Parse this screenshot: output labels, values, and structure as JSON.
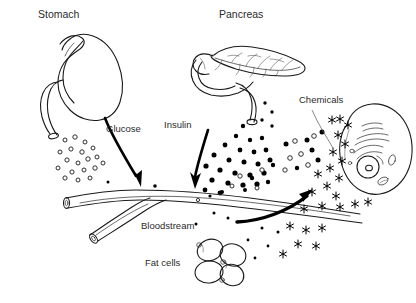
{
  "figure": {
    "background_color": "#ffffff",
    "ink_color": "#1a1a1a",
    "width": 416,
    "height": 303
  },
  "labels": {
    "stomach": "Stomach",
    "pancreas": "Pancreas",
    "glucose": "Glucose",
    "insulin": "Insulin",
    "chemicals": "Chemicals",
    "bloodstream": "Bloodstream",
    "fat_cells": "Fat cells"
  },
  "structures": [
    {
      "name": "stomach",
      "label": "Stomach",
      "description": "outline drawing of a stomach with duodenum outlet at lower left",
      "label_position": {
        "x": 38,
        "y": 18
      }
    },
    {
      "name": "pancreas",
      "label": "Pancreas",
      "description": "outline drawing of pancreas with duodenum loop and internal duct branches",
      "label_position": {
        "x": 219,
        "y": 18
      }
    },
    {
      "name": "bloodstream",
      "label": "Bloodstream",
      "description": "Y-shaped branching blood vessel tube with open cut ends",
      "label_position": {
        "x": 141,
        "y": 228
      }
    },
    {
      "name": "fat-cells",
      "label": "Fat cells",
      "description": "cluster of four overlapping oval adipocytes",
      "label_position": {
        "x": 145,
        "y": 265
      }
    },
    {
      "name": "target-cell",
      "label": "",
      "description": "large target cell with nucleus, nucleolus and internal organelles",
      "label_position": {
        "x": 0,
        "y": 0
      }
    },
    {
      "name": "chemicals",
      "label": "Chemicals",
      "description": "asterisk-shaped chemical signal markers along cell membrane",
      "label_position": {
        "x": 299,
        "y": 102
      }
    }
  ],
  "particles": {
    "glucose": {
      "style": "open-circle",
      "label": "Glucose",
      "fill": "#ffffff",
      "stroke": "#1a1a1a",
      "count": 27
    },
    "insulin": {
      "style": "filled-circle",
      "label": "Insulin",
      "fill": "#000000",
      "count": 34
    },
    "chemical": {
      "style": "asterisk",
      "label": "Chemicals",
      "stroke": "#000000",
      "count": 24
    }
  },
  "arrows": [
    {
      "name": "glucose-arrow",
      "from": "stomach",
      "to": "bloodstream",
      "label": "Glucose"
    },
    {
      "name": "insulin-arrow",
      "from": "pancreas",
      "to": "bloodstream",
      "label": "Insulin"
    },
    {
      "name": "uptake-arrow",
      "from": "bloodstream",
      "to": "target-cell",
      "label": ""
    }
  ]
}
